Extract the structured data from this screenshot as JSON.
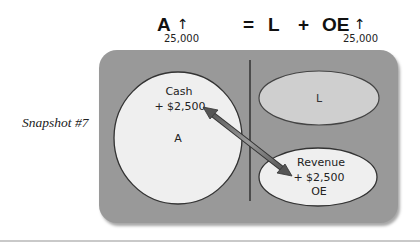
{
  "equation": {
    "assets": {
      "label": "A",
      "direction": "↑",
      "amount": "25,000"
    },
    "equals": "=",
    "liabilities": {
      "label": "L"
    },
    "plus": "+",
    "owners_equity": {
      "label": "OE",
      "direction": "↑",
      "amount": "25,000"
    }
  },
  "snapshot_label": "Snapshot #7",
  "diagram": {
    "colors": {
      "panel": "#999999",
      "shape_light": "#efefef",
      "shape_liability": "#cfcfcf",
      "outline": "#333333",
      "arrow": "#6e6e6e"
    },
    "assets_circle": {
      "account": "Cash",
      "change": "+ $2,500",
      "category": "A"
    },
    "liabilities_ellipse": {
      "category": "L"
    },
    "equity_ellipse": {
      "account": "Revenue",
      "change": "+ $2,500",
      "category": "OE"
    },
    "arrow": {
      "type": "double-headed",
      "from": "Cash",
      "to": "Revenue"
    }
  }
}
